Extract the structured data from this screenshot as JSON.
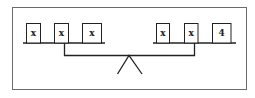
{
  "diagram": {
    "type": "balance-scale",
    "left_pan": {
      "items": [
        {
          "label": "x"
        },
        {
          "label": "x"
        },
        {
          "label": "x"
        }
      ]
    },
    "right_pan": {
      "items": [
        {
          "label": "x"
        },
        {
          "label": "x"
        },
        {
          "label": "4"
        }
      ]
    },
    "colors": {
      "line": "#222222",
      "frame": "#6b6b6b",
      "background": "#ffffff"
    }
  }
}
